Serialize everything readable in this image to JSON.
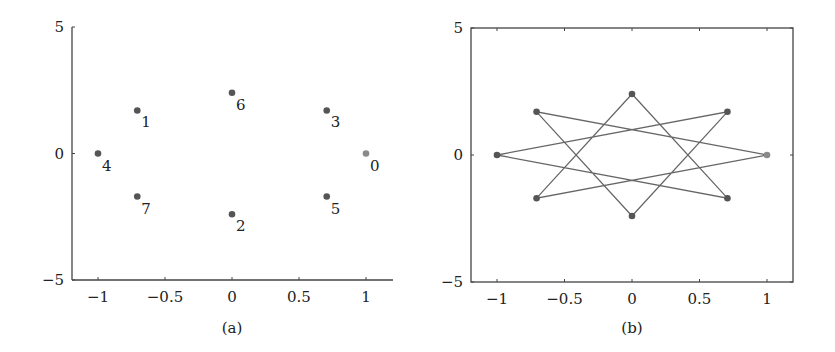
{
  "chart_data": [
    {
      "id": "a",
      "type": "scatter",
      "caption": "(a)",
      "title": "",
      "xlabel": "",
      "ylabel": "",
      "xlim": [
        -1.2,
        1.2
      ],
      "ylim": [
        -5,
        5
      ],
      "xticks": [
        -1,
        -0.5,
        0,
        0.5,
        1
      ],
      "xtick_labels": [
        "−1",
        "−0.5",
        "0",
        "0.5",
        "1"
      ],
      "yticks": [
        -5,
        0,
        5
      ],
      "ytick_labels": [
        "−5",
        "0",
        "5"
      ],
      "grid": false,
      "frame": "left-bottom",
      "points": [
        {
          "label": "0",
          "x": 1.0,
          "y": 0.0,
          "color": "#8a8a8a"
        },
        {
          "label": "1",
          "x": -0.707,
          "y": 1.7,
          "color": "#555555"
        },
        {
          "label": "2",
          "x": 0.0,
          "y": -2.4,
          "color": "#555555"
        },
        {
          "label": "3",
          "x": 0.707,
          "y": 1.7,
          "color": "#555555"
        },
        {
          "label": "4",
          "x": -1.0,
          "y": 0.0,
          "color": "#555555"
        },
        {
          "label": "5",
          "x": 0.707,
          "y": -1.7,
          "color": "#555555"
        },
        {
          "label": "6",
          "x": 0.0,
          "y": 2.4,
          "color": "#555555"
        },
        {
          "label": "7",
          "x": -0.707,
          "y": -1.7,
          "color": "#555555"
        }
      ]
    },
    {
      "id": "b",
      "type": "line",
      "caption": "(b)",
      "title": "",
      "xlabel": "",
      "ylabel": "",
      "xlim": [
        -1.2,
        1.2
      ],
      "ylim": [
        -5,
        5
      ],
      "xticks": [
        -1,
        -0.5,
        0,
        0.5,
        1
      ],
      "xtick_labels": [
        "−1",
        "−0.5",
        "0",
        "0.5",
        "1"
      ],
      "yticks": [
        -5,
        0,
        5
      ],
      "ytick_labels": [
        "−5",
        "0",
        "5"
      ],
      "grid": false,
      "frame": "box",
      "line_color": "#666666",
      "series": [
        {
          "name": "star path 0→1→2→3→4→5→6→7→0",
          "x": [
            1.0,
            -0.707,
            0.0,
            0.707,
            -1.0,
            0.707,
            0.0,
            -0.707,
            1.0
          ],
          "y": [
            0.0,
            1.7,
            -2.4,
            1.7,
            0.0,
            -1.7,
            2.4,
            -1.7,
            0.0
          ],
          "point_colors": [
            "#8a8a8a",
            "#555555",
            "#555555",
            "#555555",
            "#555555",
            "#555555",
            "#555555",
            "#555555",
            "#8a8a8a"
          ]
        }
      ]
    }
  ]
}
